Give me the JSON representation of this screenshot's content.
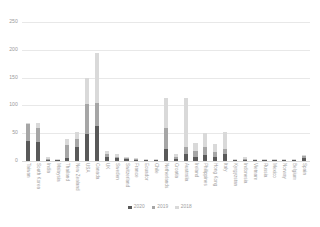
{
  "chart_data": {
    "type": "bar",
    "subtype": "stacked-column",
    "title": "",
    "xlabel": "",
    "ylabel": "",
    "ylim": [
      0,
      250
    ],
    "yticks": [
      0,
      50,
      100,
      150,
      200,
      250
    ],
    "grid": true,
    "legend_position": "bottom",
    "categories": [
      "Taiwan",
      "South Korea",
      "India",
      "Malaysia",
      "Thailand",
      "New Zealand",
      "USA",
      "Canada",
      "UK",
      "Sweden",
      "Switzerland",
      "France",
      "Ecuador",
      "Chile",
      "Netherlands",
      "Croatia",
      "Australia",
      "Ireland",
      "Philippines",
      "Hong Kong",
      "Italy",
      "Kyrgyzstan",
      "Indonesia",
      "Vietnam",
      "Russia",
      "Mexico",
      "Norway",
      "Belgium",
      "Spain"
    ],
    "series": [
      {
        "name": "2020",
        "color": "#595959",
        "values": [
          36,
          34,
          2,
          1,
          6,
          26,
          48,
          63,
          7,
          5,
          3,
          2,
          1,
          1,
          22,
          3,
          13,
          8,
          11,
          7,
          12,
          1,
          2,
          1,
          1,
          1,
          1,
          1,
          6
        ]
      },
      {
        "name": "2019",
        "color": "#a6a6a6",
        "values": [
          30,
          26,
          2,
          1,
          22,
          14,
          54,
          42,
          5,
          3,
          2,
          2,
          1,
          1,
          38,
          4,
          12,
          10,
          14,
          9,
          10,
          1,
          2,
          1,
          1,
          1,
          1,
          1,
          3
        ]
      },
      {
        "name": "2018",
        "color": "#d9d9d9",
        "values": [
          2,
          8,
          3,
          1,
          12,
          12,
          48,
          90,
          6,
          4,
          3,
          2,
          1,
          1,
          53,
          5,
          89,
          15,
          26,
          14,
          30,
          2,
          3,
          1,
          2,
          1,
          1,
          1,
          2
        ]
      }
    ]
  },
  "legend": {
    "items": [
      {
        "label": "2020",
        "color": "#595959"
      },
      {
        "label": "2019",
        "color": "#a6a6a6"
      },
      {
        "label": "2018",
        "color": "#d9d9d9"
      }
    ]
  },
  "axis": {
    "y_tick_labels": [
      "250",
      "200",
      "150",
      "100",
      "50",
      "0"
    ]
  }
}
